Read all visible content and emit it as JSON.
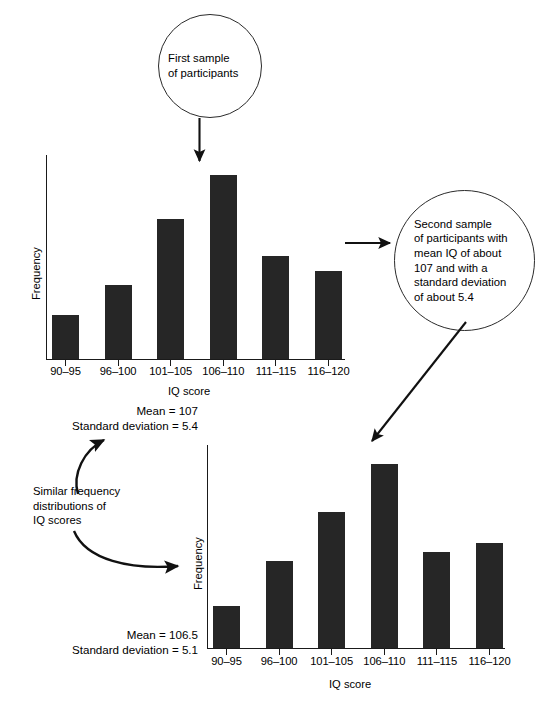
{
  "callouts": [
    {
      "id": "first-sample",
      "text": "First sample\nof participants"
    },
    {
      "id": "second-sample",
      "text": "Second sample\nof participants with\nmean IQ of about\n107 and with a\nstandard deviation\nof about 5.4"
    }
  ],
  "note": {
    "text": "Similar frequency\ndistributions of\nIQ scores"
  },
  "stats": [
    {
      "id": "sample-1-stats",
      "text": "Mean = 107\nStandard deviation = 5.4"
    },
    {
      "id": "sample-2-stats",
      "text": "Mean = 106.5\nStandard deviation = 5.1"
    }
  ],
  "chart_data": [
    {
      "id": "chart-sample-1",
      "type": "bar",
      "title": "",
      "xlabel": "IQ score",
      "ylabel": "Frequency",
      "categories": [
        "90–95",
        "96–100",
        "101–105",
        "106–110",
        "111–115",
        "116–120"
      ],
      "values": [
        24,
        40,
        76,
        100,
        56,
        48
      ],
      "ylim": [
        0,
        108
      ],
      "grid": false,
      "legend": false,
      "annotation": "arrow pointing down to 106–110 bar",
      "bar_color": "#262626"
    },
    {
      "id": "chart-sample-2",
      "type": "bar",
      "title": "",
      "xlabel": "IQ score",
      "ylabel": "Frequency",
      "categories": [
        "90–95",
        "96–100",
        "101–105",
        "106–110",
        "111–115",
        "116–120"
      ],
      "values": [
        23,
        47,
        74,
        100,
        52,
        57
      ],
      "ylim": [
        0,
        108
      ],
      "grid": false,
      "legend": false,
      "annotation": "arrow pointing down-left to 106–110 bar",
      "bar_color": "#262626"
    }
  ],
  "connectors": [
    {
      "id": "bubble1-to-chart1",
      "kind": "straight-arrow-down"
    },
    {
      "id": "chart1-to-bubble2",
      "kind": "straight-arrow-right"
    },
    {
      "id": "bubble2-to-chart2",
      "kind": "diagonal-arrow-down-left"
    },
    {
      "id": "note-to-stats1",
      "kind": "curved-arrow-up"
    },
    {
      "id": "note-to-chart2",
      "kind": "curved-arrow-right"
    }
  ]
}
